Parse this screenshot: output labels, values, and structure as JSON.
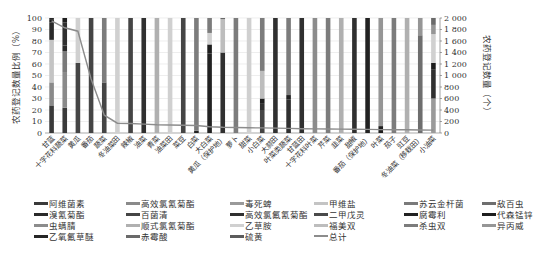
{
  "chart_data": {
    "type": "bar",
    "subtype": "stacked-percent-bar-with-line",
    "title": "",
    "ylabel": "农药登记数量比例（%）",
    "y2label": "农药登记数量（个）",
    "xlabel": "",
    "ylim": [
      0,
      100
    ],
    "y2lim": [
      0,
      2000
    ],
    "yticks": [
      "0",
      "10",
      "20",
      "30",
      "40",
      "50",
      "60",
      "70",
      "80",
      "90",
      "100"
    ],
    "y2ticks": [
      "0",
      "200",
      "400",
      "600",
      "800",
      "1 000",
      "1 200",
      "1 400",
      "1 600",
      "1 800",
      "2 000"
    ],
    "grid": true,
    "legend_position": "bottom",
    "categories": [
      "甘蓝",
      "十字花科蔬菜",
      "黄瓜",
      "番茄",
      "蔬菜",
      "冬油菜田",
      "辣椒",
      "油菜",
      "青菜",
      "油菜田",
      "菜豆",
      "白菜",
      "大白菜",
      "黄瓜（保护地）",
      "萝卜",
      "甜菜",
      "小白菜",
      "大蒜田",
      "叶菜类蔬菜",
      "甘蓝田",
      "十字花科叶菜",
      "芹菜",
      "韭菜",
      "甜椒",
      "番茄（保护地）",
      "叶菜",
      "茄子",
      "豇豆",
      "冬油菜（移栽田）",
      "小油菜"
    ],
    "series": [
      {
        "name": "阿维菌素",
        "color": "#3a3a3a",
        "values": [
          24,
          22,
          0,
          0,
          0,
          0,
          0,
          0,
          0,
          0,
          0,
          0,
          0,
          0,
          0,
          0,
          0,
          0,
          0,
          0,
          0,
          0,
          0,
          0,
          0,
          0,
          0,
          0,
          0,
          0
        ]
      },
      {
        "name": "高效氯氰菊酯",
        "color": "#8a8a8a",
        "values": [
          20,
          31,
          0,
          0,
          0,
          0,
          0,
          0,
          0,
          0,
          0,
          0,
          0,
          0,
          0,
          0,
          0,
          0,
          0,
          0,
          0,
          0,
          0,
          0,
          0,
          0,
          0,
          0,
          0,
          0
        ]
      },
      {
        "name": "毒死蜱",
        "color": "#9a9a9a",
        "values": [
          0,
          0,
          0,
          0,
          0,
          0,
          0,
          0,
          0,
          0,
          0,
          0,
          0,
          0,
          0,
          0,
          0,
          0,
          0,
          0,
          0,
          0,
          0,
          0,
          0,
          0,
          0,
          0,
          0,
          30
        ]
      },
      {
        "name": "甲维盐",
        "color": "#c4c4c4",
        "values": [
          37,
          0,
          0,
          0,
          0,
          0,
          0,
          0,
          0,
          0,
          0,
          0,
          0,
          0,
          0,
          0,
          0,
          0,
          0,
          0,
          0,
          0,
          0,
          0,
          0,
          0,
          0,
          0,
          0,
          0
        ]
      },
      {
        "name": "苏云金杆菌",
        "color": "#7a7a7a",
        "values": [
          0,
          18,
          0,
          0,
          0,
          0,
          0,
          0,
          0,
          0,
          0,
          0,
          0,
          0,
          0,
          0,
          0,
          0,
          0,
          0,
          0,
          0,
          0,
          0,
          0,
          0,
          0,
          0,
          0,
          0
        ]
      },
      {
        "name": "敌百虫",
        "color": "#6e6e6e",
        "values": [
          0,
          0,
          0,
          0,
          0,
          0,
          0,
          0,
          0,
          0,
          0,
          0,
          0,
          0,
          0,
          0,
          0,
          0,
          0,
          0,
          0,
          0,
          0,
          0,
          0,
          0,
          0,
          0,
          85,
          0
        ]
      },
      {
        "name": "溴氰菊酯",
        "color": "#2a2a2a",
        "values": [
          15,
          5,
          0,
          0,
          0,
          0,
          0,
          0,
          0,
          0,
          0,
          0,
          0,
          0,
          0,
          0,
          0,
          0,
          0,
          0,
          0,
          0,
          0,
          0,
          0,
          0,
          0,
          0,
          0,
          0
        ]
      },
      {
        "name": "百菌清",
        "color": "#454545",
        "values": [
          0,
          0,
          61,
          100,
          44,
          0,
          100,
          0,
          0,
          0,
          100,
          0,
          0,
          0,
          0,
          0,
          20,
          0,
          0,
          0,
          0,
          0,
          0,
          0,
          0,
          0,
          0,
          0,
          0,
          0
        ]
      },
      {
        "name": "高效氯氟氰菊酯",
        "color": "#303030",
        "values": [
          0,
          20,
          0,
          0,
          0,
          0,
          0,
          100,
          0,
          0,
          0,
          0,
          0,
          70,
          0,
          0,
          6,
          100,
          29,
          100,
          0,
          0,
          0,
          100,
          0,
          0,
          0,
          0,
          0,
          25
        ]
      },
      {
        "name": "二甲戊灵",
        "color": "#4a4a4a",
        "values": [
          0,
          0,
          0,
          0,
          0,
          0,
          0,
          0,
          0,
          0,
          0,
          0,
          0,
          0,
          0,
          0,
          0,
          0,
          0,
          0,
          0,
          0,
          0,
          0,
          0,
          0,
          0,
          0,
          0,
          0
        ]
      },
      {
        "name": "腐霉利",
        "color": "#222222",
        "values": [
          0,
          0,
          0,
          0,
          0,
          0,
          0,
          0,
          0,
          0,
          0,
          2,
          69,
          0,
          0,
          0,
          0,
          0,
          4,
          0,
          0,
          0,
          0,
          0,
          100,
          0,
          0,
          0,
          0,
          0
        ]
      },
      {
        "name": "代森锰锌",
        "color": "#1e1e1e",
        "values": [
          3,
          4,
          0,
          0,
          0,
          0,
          0,
          0,
          0,
          0,
          0,
          0,
          8,
          0,
          0,
          0,
          4,
          0,
          0,
          0,
          0,
          0,
          0,
          0,
          0,
          6,
          0,
          0,
          0,
          6
        ]
      },
      {
        "name": "虫螨腈",
        "color": "#8c8c8c",
        "values": [
          0,
          0,
          0,
          0,
          0,
          0,
          0,
          0,
          0,
          0,
          0,
          0,
          0,
          0,
          0,
          0,
          0,
          0,
          0,
          0,
          100,
          0,
          0,
          0,
          0,
          0,
          0,
          0,
          0,
          0
        ]
      },
      {
        "name": "顺式氯氰菊酯",
        "color": "#b0b0b0",
        "values": [
          0,
          0,
          0,
          0,
          0,
          0,
          0,
          0,
          100,
          0,
          0,
          0,
          0,
          0,
          0,
          0,
          0,
          0,
          0,
          0,
          0,
          0,
          100,
          0,
          0,
          0,
          0,
          100,
          0,
          0
        ]
      },
      {
        "name": "乙草胺",
        "color": "#d0d0d0",
        "values": [
          0,
          0,
          39,
          0,
          0,
          100,
          0,
          0,
          0,
          100,
          0,
          0,
          10,
          0,
          0,
          100,
          0,
          0,
          0,
          0,
          0,
          0,
          0,
          0,
          0,
          0,
          0,
          0,
          0,
          25
        ]
      },
      {
        "name": "福美双",
        "color": "#bdbdbd",
        "values": [
          0,
          0,
          0,
          0,
          0,
          0,
          0,
          0,
          0,
          0,
          0,
          0,
          0,
          29,
          0,
          0,
          24,
          0,
          0,
          0,
          0,
          0,
          0,
          0,
          0,
          0,
          0,
          0,
          0,
          0
        ]
      },
      {
        "name": "杀虫双",
        "color": "#7c7c7c",
        "values": [
          0,
          0,
          0,
          0,
          56,
          0,
          0,
          0,
          0,
          0,
          0,
          98,
          13,
          0,
          100,
          0,
          46,
          0,
          67,
          0,
          0,
          100,
          0,
          0,
          0,
          0,
          100,
          0,
          0,
          0
        ]
      },
      {
        "name": "异丙威",
        "color": "#969696",
        "values": [
          0,
          0,
          0,
          0,
          0,
          0,
          0,
          0,
          0,
          0,
          0,
          0,
          0,
          0,
          0,
          0,
          0,
          0,
          0,
          0,
          0,
          0,
          0,
          0,
          0,
          94,
          0,
          0,
          15,
          8
        ]
      },
      {
        "name": "乙氧氟草醚",
        "color": "#262626",
        "values": [
          1,
          0,
          0,
          0,
          0,
          0,
          0,
          0,
          0,
          0,
          0,
          0,
          0,
          0,
          0,
          0,
          0,
          0,
          0,
          0,
          0,
          0,
          0,
          0,
          0,
          0,
          0,
          0,
          0,
          0
        ]
      },
      {
        "name": "赤霉酸",
        "color": "#6a6a6a",
        "values": [
          0,
          0,
          0,
          0,
          0,
          0,
          0,
          0,
          0,
          0,
          0,
          0,
          0,
          1,
          0,
          0,
          0,
          0,
          0,
          0,
          0,
          0,
          0,
          0,
          0,
          0,
          0,
          0,
          0,
          6
        ]
      },
      {
        "name": "硫黄",
        "color": "#5c5c5c",
        "values": [
          0,
          0,
          0,
          0,
          0,
          0,
          0,
          0,
          0,
          0,
          0,
          0,
          0,
          0,
          0,
          0,
          0,
          0,
          0,
          0,
          0,
          0,
          0,
          0,
          0,
          0,
          0,
          0,
          0,
          0
        ]
      }
    ],
    "line_series": {
      "name": "总计",
      "color": "#8c8c8c",
      "axis": "right",
      "values": [
        1950,
        1830,
        1770,
        940,
        310,
        170,
        165,
        155,
        145,
        140,
        135,
        130,
        110,
        100,
        95,
        90,
        88,
        85,
        80,
        75,
        72,
        70,
        68,
        65,
        62,
        60,
        58,
        55,
        52,
        50
      ]
    }
  },
  "legend": {
    "items": [
      {
        "label": "阿维菌素",
        "color": "#3a3a3a"
      },
      {
        "label": "高效氯氰菊酯",
        "color": "#8a8a8a"
      },
      {
        "label": "毒死蜱",
        "color": "#9a9a9a"
      },
      {
        "label": "甲维盐",
        "color": "#c4c4c4"
      },
      {
        "label": "苏云金杆菌",
        "color": "#7a7a7a"
      },
      {
        "label": "敌百虫",
        "color": "#6e6e6e"
      },
      {
        "label": "溴氰菊酯",
        "color": "#2a2a2a"
      },
      {
        "label": "百菌清",
        "color": "#454545"
      },
      {
        "label": "高效氯氟氰菊酯",
        "color": "#303030"
      },
      {
        "label": "二甲戊灵",
        "color": "#4a4a4a"
      },
      {
        "label": "腐霉利",
        "color": "#222222"
      },
      {
        "label": "代森锰锌",
        "color": "#1e1e1e"
      },
      {
        "label": "虫螨腈",
        "color": "#8c8c8c"
      },
      {
        "label": "顺式氯氰菊酯",
        "color": "#b0b0b0"
      },
      {
        "label": "乙草胺",
        "color": "#d0d0d0"
      },
      {
        "label": "福美双",
        "color": "#bdbdbd"
      },
      {
        "label": "杀虫双",
        "color": "#7c7c7c"
      },
      {
        "label": "异丙威",
        "color": "#969696"
      },
      {
        "label": "乙氧氟草醚",
        "color": "#262626"
      },
      {
        "label": "赤霉酸",
        "color": "#6a6a6a"
      },
      {
        "label": "硫黄",
        "color": "#5c5c5c"
      },
      {
        "label": "总计",
        "color": "#8c8c8c",
        "type": "line"
      }
    ]
  }
}
